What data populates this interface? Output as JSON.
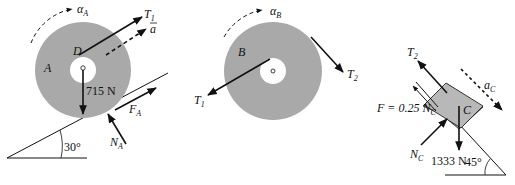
{
  "figure": {
    "panels": [
      {
        "id": "disk-A",
        "body_label": "A",
        "point_label": "D",
        "angular_accel": "α",
        "angular_accel_sub": "A",
        "tension": "T",
        "tension_sub": "1",
        "accel": "a",
        "weight": "715 N",
        "friction": "F",
        "friction_sub": "A",
        "normal": "N",
        "normal_sub": "A",
        "incline_angle": "30°"
      },
      {
        "id": "disk-B",
        "body_label": "B",
        "angular_accel": "α",
        "angular_accel_sub": "B",
        "tension_left": "T",
        "tension_left_sub": "1",
        "tension_right": "T",
        "tension_right_sub": "2"
      },
      {
        "id": "block-C",
        "body_label": "C",
        "tension": "T",
        "tension_sub": "2",
        "accel": "a",
        "accel_sub": "C",
        "friction_eq": "F = 0.25 N",
        "friction_eq_sub": "C",
        "normal": "N",
        "normal_sub": "C",
        "weight": "1333 N",
        "incline_angle": "45°"
      }
    ],
    "colors": {
      "disk_fill": "#a9a9a9",
      "block_fill": "#b8b8b8",
      "ink": "#111111",
      "background": "#ffffff"
    }
  }
}
